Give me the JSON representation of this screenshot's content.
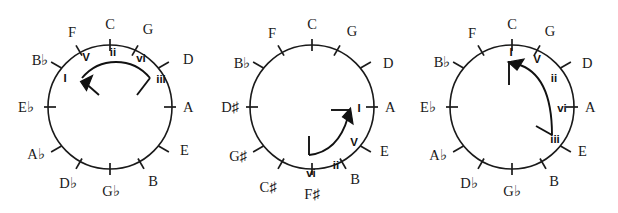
{
  "figure": {
    "name": "circle-of-fifths-progression-diagrams",
    "background_color": "#ffffff",
    "ink_color": "#1a1a1a",
    "panel_count": 3
  },
  "panels": [
    {
      "id": "panel-c-major",
      "key_center": "C",
      "notes": [
        {
          "label": "C",
          "angle_deg": 0
        },
        {
          "label": "G",
          "angle_deg": 30
        },
        {
          "label": "D",
          "angle_deg": 60
        },
        {
          "label": "A",
          "angle_deg": 90
        },
        {
          "label": "E",
          "angle_deg": 120
        },
        {
          "label": "B",
          "angle_deg": 150
        },
        {
          "label": "G♭",
          "angle_deg": 180
        },
        {
          "label": "D♭",
          "angle_deg": 210
        },
        {
          "label": "A♭",
          "angle_deg": 240
        },
        {
          "label": "E♭",
          "angle_deg": 270
        },
        {
          "label": "B♭",
          "angle_deg": 300
        },
        {
          "label": "F",
          "angle_deg": 330
        }
      ],
      "degrees": [
        {
          "label": "I",
          "angle_deg": 300
        },
        {
          "label": "V",
          "angle_deg": 330
        },
        {
          "label": "ii",
          "angle_deg": 0
        },
        {
          "label": "vi",
          "angle_deg": 30
        },
        {
          "label": "iii",
          "angle_deg": 60
        }
      ],
      "arrow": {
        "from_degree": "iii",
        "to_degree": "I",
        "direction": "counterclockwise",
        "start_angle_deg": 60,
        "end_angle_deg": 300
      }
    },
    {
      "id": "panel-a-major",
      "key_center": "A",
      "notes": [
        {
          "label": "C",
          "angle_deg": 0
        },
        {
          "label": "G",
          "angle_deg": 30
        },
        {
          "label": "D",
          "angle_deg": 60
        },
        {
          "label": "A",
          "angle_deg": 90
        },
        {
          "label": "E",
          "angle_deg": 120
        },
        {
          "label": "B",
          "angle_deg": 150
        },
        {
          "label": "F♯",
          "angle_deg": 180
        },
        {
          "label": "C♯",
          "angle_deg": 210
        },
        {
          "label": "G♯",
          "angle_deg": 240
        },
        {
          "label": "D♯",
          "angle_deg": 270
        },
        {
          "label": "B♭",
          "angle_deg": 300
        },
        {
          "label": "F",
          "angle_deg": 330
        }
      ],
      "degrees": [
        {
          "label": "I",
          "angle_deg": 90
        },
        {
          "label": "V",
          "angle_deg": 120
        },
        {
          "label": "ii",
          "angle_deg": 150
        },
        {
          "label": "vi",
          "angle_deg": 180
        }
      ],
      "arrow": {
        "from_degree": "vi",
        "to_degree": "I",
        "direction": "counterclockwise",
        "start_angle_deg": 180,
        "end_angle_deg": 90
      }
    },
    {
      "id": "panel-c-major-alt",
      "key_center": "C",
      "notes": [
        {
          "label": "C",
          "angle_deg": 0
        },
        {
          "label": "G",
          "angle_deg": 30
        },
        {
          "label": "D",
          "angle_deg": 60
        },
        {
          "label": "A",
          "angle_deg": 90
        },
        {
          "label": "E",
          "angle_deg": 120
        },
        {
          "label": "B",
          "angle_deg": 150
        },
        {
          "label": "G♭",
          "angle_deg": 180
        },
        {
          "label": "D♭",
          "angle_deg": 210
        },
        {
          "label": "A♭",
          "angle_deg": 240
        },
        {
          "label": "E♭",
          "angle_deg": 270
        },
        {
          "label": "B♭",
          "angle_deg": 300
        },
        {
          "label": "F",
          "angle_deg": 330
        }
      ],
      "degrees": [
        {
          "label": "I",
          "angle_deg": 0
        },
        {
          "label": "V",
          "angle_deg": 30
        },
        {
          "label": "ii",
          "angle_deg": 60
        },
        {
          "label": "vi",
          "angle_deg": 90
        },
        {
          "label": "iii",
          "angle_deg": 120
        }
      ],
      "arrow": {
        "from_degree": "iii",
        "to_degree": "I",
        "direction": "counterclockwise",
        "start_angle_deg": 120,
        "end_angle_deg": 0
      }
    }
  ],
  "geometry": {
    "panel_width": 206,
    "panel_height": 213,
    "center_x": 110,
    "center_y": 107,
    "radius": 62,
    "tick_outer": 6,
    "tick_inner": 6
  }
}
